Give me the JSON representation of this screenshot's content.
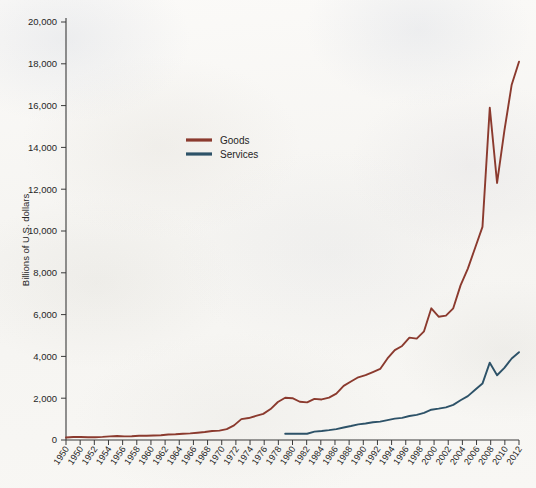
{
  "chart_data": {
    "type": "line",
    "title": "",
    "subtitle": "",
    "xlabel": "",
    "ylabel": "Billions of U.S. dollars",
    "xlim": [
      1950,
      2012
    ],
    "ylim": [
      0,
      20000
    ],
    "grid": false,
    "legend_position": "upper-center-left",
    "y_ticks": [
      0,
      2000,
      4000,
      6000,
      8000,
      10000,
      12000,
      14000,
      16000,
      18000,
      20000
    ],
    "y_tick_labels": [
      "0",
      "2,000",
      "4,000",
      "6,000",
      "8,000",
      "10,000",
      "12,000",
      "14,000",
      "16,000",
      "18,000",
      "20,000"
    ],
    "x_tick_labels": [
      "1950",
      "1950",
      "1952",
      "1954",
      "1956",
      "1958",
      "1960",
      "1962",
      "1964",
      "1966",
      "1968",
      "1970",
      "1972",
      "1974",
      "1976",
      "1978",
      "1980",
      "1982",
      "1984",
      "1986",
      "1988",
      "1990",
      "1992",
      "1994",
      "1996",
      "1998",
      "2000",
      "2002",
      "2004",
      "2006",
      "2008",
      "2010",
      "2012"
    ],
    "x": [
      1950,
      1951,
      1952,
      1953,
      1954,
      1955,
      1956,
      1957,
      1958,
      1959,
      1960,
      1961,
      1962,
      1963,
      1964,
      1965,
      1966,
      1967,
      1968,
      1969,
      1970,
      1971,
      1972,
      1973,
      1974,
      1975,
      1976,
      1977,
      1978,
      1979,
      1980,
      1981,
      1982,
      1983,
      1984,
      1985,
      1986,
      1987,
      1988,
      1989,
      1990,
      1991,
      1992,
      1993,
      1994,
      1995,
      1996,
      1997,
      1998,
      1999,
      2000,
      2001,
      2002,
      2003,
      2004,
      2005,
      2006,
      2007,
      2008,
      2009,
      2010,
      2011,
      2012
    ],
    "series": [
      {
        "name": "Goods",
        "color": "#8B3A2E",
        "values": [
          120,
          140,
          140,
          135,
          135,
          150,
          175,
          190,
          175,
          180,
          200,
          205,
          215,
          230,
          260,
          275,
          300,
          315,
          350,
          380,
          430,
          450,
          520,
          700,
          1000,
          1050,
          1150,
          1250,
          1480,
          1820,
          2020,
          2000,
          1830,
          1800,
          1970,
          1940,
          2030,
          2220,
          2590,
          2800,
          3000,
          3100,
          3250,
          3400,
          3900,
          4300,
          4500,
          4900,
          4850,
          5200,
          6300,
          5900,
          5950,
          6300,
          7400,
          8200,
          9200,
          10200,
          15900,
          12300,
          14800,
          17000,
          18100
        ]
      },
      {
        "name": "Services",
        "color": "#2D5268",
        "values": [
          null,
          null,
          null,
          null,
          null,
          null,
          null,
          null,
          null,
          null,
          null,
          null,
          null,
          null,
          null,
          null,
          null,
          null,
          null,
          null,
          null,
          null,
          null,
          null,
          null,
          null,
          null,
          null,
          null,
          null,
          300,
          300,
          300,
          300,
          400,
          430,
          470,
          520,
          600,
          670,
          750,
          790,
          850,
          880,
          950,
          1020,
          1060,
          1150,
          1200,
          1300,
          1450,
          1500,
          1560,
          1680,
          1900,
          2100,
          2400,
          2700,
          3700,
          3100,
          3450,
          3900,
          4200
        ]
      }
    ],
    "legend": [
      {
        "label": "Goods",
        "color": "#8B3A2E"
      },
      {
        "label": "Services",
        "color": "#2D5268"
      }
    ]
  },
  "colors": {
    "goods": "#8B3A2E",
    "services": "#2D5268",
    "axis": "#3a3a3a",
    "text": "#262626",
    "background": "#f7f6f3"
  }
}
